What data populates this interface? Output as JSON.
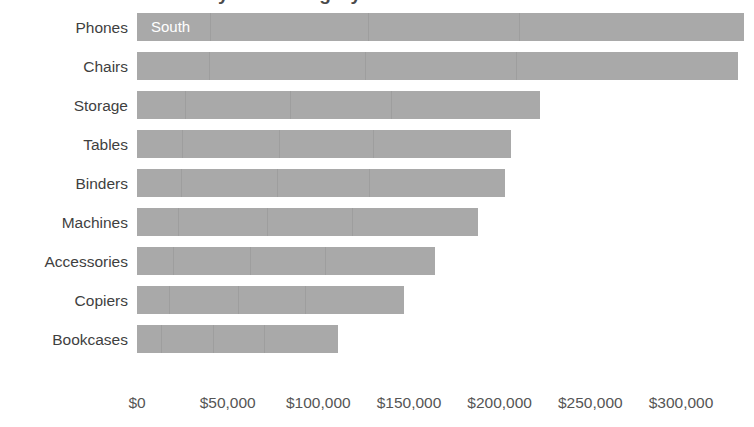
{
  "chart_title_cropped": "Sales by Sub-Category",
  "series_label": "South",
  "chart_data": {
    "type": "bar",
    "orientation": "horizontal",
    "title": "Sales by Sub-Category",
    "xlabel": "",
    "ylabel": "",
    "grid": false,
    "legend_position": "in-bar",
    "series": [
      {
        "name": "South",
        "values": [
          334800,
          331500,
          222300,
          206300,
          203000,
          188100,
          164400,
          147300,
          110900
        ]
      }
    ],
    "categories": [
      "Phones",
      "Chairs",
      "Storage",
      "Tables",
      "Binders",
      "Machines",
      "Accessories",
      "Copiers",
      "Bookcases"
    ],
    "xlim": [
      0,
      340000
    ],
    "x_tick_values": [
      0,
      50000,
      100000,
      150000,
      200000,
      250000,
      300000
    ],
    "x_tick_labels": [
      "$0",
      "$50,000",
      "$100,000",
      "$150,000",
      "$200,000",
      "$250,000",
      "$300,000"
    ],
    "bar_color": "#a9a9a9",
    "background_color": "#ffffff",
    "text_color": "#3f3f3f"
  },
  "axis": {
    "ticks": [
      {
        "label": "$0",
        "value": 0
      },
      {
        "label": "$50,000",
        "value": 50000
      },
      {
        "label": "$100,000",
        "value": 100000
      },
      {
        "label": "$150,000",
        "value": 150000
      },
      {
        "label": "$200,000",
        "value": 200000
      },
      {
        "label": "$250,000",
        "value": 250000
      },
      {
        "label": "$300,000",
        "value": 300000
      }
    ]
  },
  "bars": [
    {
      "category": "Phones",
      "value": 334800
    },
    {
      "category": "Chairs",
      "value": 331500
    },
    {
      "category": "Storage",
      "value": 222300
    },
    {
      "category": "Tables",
      "value": 206300
    },
    {
      "category": "Binders",
      "value": 203000
    },
    {
      "category": "Machines",
      "value": 188100
    },
    {
      "category": "Accessories",
      "value": 164400
    },
    {
      "category": "Copiers",
      "value": 147300
    },
    {
      "category": "Bookcases",
      "value": 110900
    }
  ]
}
